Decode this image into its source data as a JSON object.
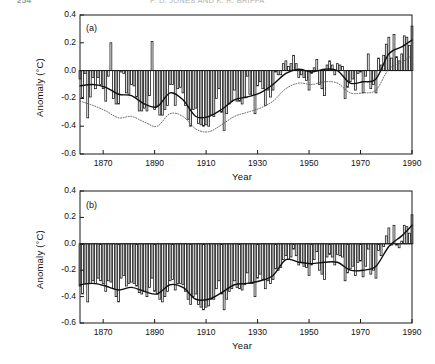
{
  "page": {
    "folio": "254",
    "running_head": "P. D. JONES AND K. R. BRIFFA"
  },
  "figure": {
    "panels": [
      {
        "tag": "(a)",
        "ylabel": "Anomaly (°C)",
        "xlabel": "Year"
      },
      {
        "tag": "(b)",
        "ylabel": "Anomaly (°C)",
        "xlabel": "Year"
      }
    ]
  },
  "chart_data": [
    {
      "type": "bar",
      "panel": "(a)",
      "title": "",
      "xlabel": "Year",
      "ylabel": "Anomaly (°C)",
      "xlim": [
        1861,
        1990
      ],
      "ylim": [
        -0.6,
        0.4
      ],
      "yticks": [
        -0.6,
        -0.4,
        -0.2,
        0.0,
        0.2,
        0.4
      ],
      "xticks": [
        1870,
        1890,
        1910,
        1930,
        1950,
        1970,
        1990
      ],
      "grid": false,
      "legend": null,
      "zero_line": 0.0,
      "series": [
        {
          "name": "Annual anomaly",
          "render": "bar",
          "x": [
            1861,
            1862,
            1863,
            1864,
            1865,
            1866,
            1867,
            1868,
            1869,
            1870,
            1871,
            1872,
            1873,
            1874,
            1875,
            1876,
            1877,
            1878,
            1879,
            1880,
            1881,
            1882,
            1883,
            1884,
            1885,
            1886,
            1887,
            1888,
            1889,
            1890,
            1891,
            1892,
            1893,
            1894,
            1895,
            1896,
            1897,
            1898,
            1899,
            1900,
            1901,
            1902,
            1903,
            1904,
            1905,
            1906,
            1907,
            1908,
            1909,
            1910,
            1911,
            1912,
            1913,
            1914,
            1915,
            1916,
            1917,
            1918,
            1919,
            1920,
            1921,
            1922,
            1923,
            1924,
            1925,
            1926,
            1927,
            1928,
            1929,
            1930,
            1931,
            1932,
            1933,
            1934,
            1935,
            1936,
            1937,
            1938,
            1939,
            1940,
            1941,
            1942,
            1943,
            1944,
            1945,
            1946,
            1947,
            1948,
            1949,
            1950,
            1951,
            1952,
            1953,
            1954,
            1955,
            1956,
            1957,
            1958,
            1959,
            1960,
            1961,
            1962,
            1963,
            1964,
            1965,
            1966,
            1967,
            1968,
            1969,
            1970,
            1971,
            1972,
            1973,
            1974,
            1975,
            1976,
            1977,
            1978,
            1979,
            1980,
            1981,
            1982,
            1983,
            1984,
            1985,
            1986,
            1987,
            1988,
            1989,
            1990
          ],
          "values": [
            -0.06,
            -0.2,
            -0.02,
            -0.34,
            -0.19,
            -0.05,
            -0.13,
            -0.05,
            -0.1,
            -0.13,
            -0.22,
            -0.04,
            0.2,
            -0.2,
            -0.24,
            -0.24,
            -0.01,
            -0.02,
            -0.16,
            -0.17,
            -0.1,
            -0.11,
            -0.19,
            -0.29,
            -0.29,
            -0.27,
            -0.29,
            -0.18,
            0.21,
            -0.28,
            -0.25,
            -0.32,
            -0.32,
            -0.28,
            -0.25,
            -0.1,
            -0.1,
            -0.25,
            -0.13,
            -0.12,
            -0.16,
            -0.25,
            -0.35,
            -0.4,
            -0.28,
            -0.27,
            -0.38,
            -0.39,
            -0.4,
            -0.39,
            -0.4,
            -0.32,
            -0.33,
            -0.2,
            -0.13,
            -0.3,
            -0.43,
            -0.31,
            -0.24,
            -0.22,
            -0.14,
            -0.22,
            -0.22,
            -0.24,
            -0.19,
            -0.04,
            -0.17,
            -0.18,
            -0.31,
            -0.11,
            -0.08,
            -0.13,
            -0.25,
            -0.14,
            -0.19,
            -0.14,
            -0.01,
            -0.03,
            -0.03,
            0.05,
            0.07,
            0.03,
            0.05,
            0.11,
            0.05,
            -0.05,
            -0.03,
            -0.05,
            -0.07,
            -0.14,
            -0.02,
            0.02,
            0.08,
            -0.1,
            -0.13,
            -0.18,
            0.04,
            0.07,
            0.04,
            -0.03,
            0.05,
            0.04,
            0.03,
            -0.2,
            -0.12,
            -0.08,
            -0.06,
            -0.14,
            -0.02,
            -0.01,
            -0.16,
            -0.04,
            0.12,
            -0.13,
            -0.1,
            -0.16,
            0.09,
            0.04,
            0.11,
            0.19,
            0.24,
            0.09,
            0.26,
            0.1,
            0.07,
            0.12,
            0.25,
            0.24,
            0.18,
            0.32
          ]
        },
        {
          "name": "Smoothed (filtered) curve",
          "render": "line-solid",
          "x": [
            1861,
            1866,
            1871,
            1876,
            1881,
            1886,
            1891,
            1896,
            1901,
            1906,
            1911,
            1916,
            1921,
            1926,
            1931,
            1936,
            1941,
            1946,
            1951,
            1956,
            1961,
            1966,
            1971,
            1976,
            1981,
            1986,
            1990
          ],
          "values": [
            -0.11,
            -0.1,
            -0.12,
            -0.17,
            -0.18,
            -0.24,
            -0.26,
            -0.16,
            -0.21,
            -0.33,
            -0.33,
            -0.28,
            -0.21,
            -0.19,
            -0.16,
            -0.1,
            -0.02,
            0.01,
            -0.01,
            0.01,
            0.0,
            -0.09,
            -0.08,
            -0.06,
            0.12,
            0.17,
            0.22
          ]
        },
        {
          "name": "Comparison series (dotted)",
          "render": "line-dotted",
          "x": [
            1861,
            1866,
            1871,
            1876,
            1881,
            1886,
            1891,
            1896,
            1901,
            1906,
            1911,
            1916,
            1921,
            1926,
            1931,
            1936,
            1941,
            1946,
            1951,
            1956,
            1961,
            1966,
            1971,
            1976,
            1981,
            1986,
            1990
          ],
          "values": [
            -0.22,
            -0.25,
            -0.29,
            -0.34,
            -0.33,
            -0.37,
            -0.4,
            -0.31,
            -0.33,
            -0.42,
            -0.44,
            -0.39,
            -0.33,
            -0.3,
            -0.27,
            -0.22,
            -0.13,
            -0.09,
            -0.1,
            -0.08,
            -0.09,
            -0.16,
            -0.16,
            -0.14,
            0.01,
            0.06,
            0.11
          ]
        }
      ]
    },
    {
      "type": "bar",
      "panel": "(b)",
      "title": "",
      "xlabel": "Year",
      "ylabel": "Anomaly (°C)",
      "xlim": [
        1861,
        1990
      ],
      "ylim": [
        -0.6,
        0.4
      ],
      "yticks": [
        -0.6,
        -0.4,
        -0.2,
        0.0,
        0.2,
        0.4
      ],
      "xticks": [
        1870,
        1890,
        1910,
        1930,
        1950,
        1970,
        1990
      ],
      "grid": false,
      "legend": null,
      "zero_line": 0.0,
      "series": [
        {
          "name": "Annual anomaly",
          "render": "bar",
          "x": [
            1861,
            1862,
            1863,
            1864,
            1865,
            1866,
            1867,
            1868,
            1869,
            1870,
            1871,
            1872,
            1873,
            1874,
            1875,
            1876,
            1877,
            1878,
            1879,
            1880,
            1881,
            1882,
            1883,
            1884,
            1885,
            1886,
            1887,
            1888,
            1889,
            1890,
            1891,
            1892,
            1893,
            1894,
            1895,
            1896,
            1897,
            1898,
            1899,
            1900,
            1901,
            1902,
            1903,
            1904,
            1905,
            1906,
            1907,
            1908,
            1909,
            1910,
            1911,
            1912,
            1913,
            1914,
            1915,
            1916,
            1917,
            1918,
            1919,
            1920,
            1921,
            1922,
            1923,
            1924,
            1925,
            1926,
            1927,
            1928,
            1929,
            1930,
            1931,
            1932,
            1933,
            1934,
            1935,
            1936,
            1937,
            1938,
            1939,
            1940,
            1941,
            1942,
            1943,
            1944,
            1945,
            1946,
            1947,
            1948,
            1949,
            1950,
            1951,
            1952,
            1953,
            1954,
            1955,
            1956,
            1957,
            1958,
            1959,
            1960,
            1961,
            1962,
            1963,
            1964,
            1965,
            1966,
            1967,
            1968,
            1969,
            1970,
            1971,
            1972,
            1973,
            1974,
            1975,
            1976,
            1977,
            1978,
            1979,
            1980,
            1981,
            1982,
            1983,
            1984,
            1985,
            1986,
            1987,
            1988,
            1989,
            1990
          ],
          "values": [
            -0.32,
            -0.38,
            -0.3,
            -0.44,
            -0.3,
            -0.28,
            -0.3,
            -0.26,
            -0.28,
            -0.3,
            -0.36,
            -0.28,
            -0.29,
            -0.34,
            -0.4,
            -0.44,
            -0.26,
            -0.24,
            -0.32,
            -0.3,
            -0.29,
            -0.3,
            -0.32,
            -0.37,
            -0.38,
            -0.36,
            -0.4,
            -0.33,
            -0.26,
            -0.36,
            -0.38,
            -0.42,
            -0.44,
            -0.4,
            -0.36,
            -0.28,
            -0.27,
            -0.35,
            -0.3,
            -0.3,
            -0.31,
            -0.36,
            -0.42,
            -0.46,
            -0.4,
            -0.38,
            -0.46,
            -0.48,
            -0.5,
            -0.48,
            -0.47,
            -0.42,
            -0.42,
            -0.34,
            -0.28,
            -0.38,
            -0.5,
            -0.42,
            -0.36,
            -0.34,
            -0.28,
            -0.33,
            -0.34,
            -0.35,
            -0.31,
            -0.22,
            -0.3,
            -0.3,
            -0.4,
            -0.26,
            -0.23,
            -0.27,
            -0.34,
            -0.28,
            -0.3,
            -0.27,
            -0.19,
            -0.2,
            -0.18,
            -0.12,
            -0.09,
            -0.12,
            -0.1,
            -0.04,
            -0.09,
            -0.16,
            -0.14,
            -0.17,
            -0.18,
            -0.24,
            -0.16,
            -0.12,
            -0.06,
            -0.2,
            -0.23,
            -0.27,
            -0.1,
            -0.08,
            -0.1,
            -0.16,
            -0.08,
            -0.09,
            -0.1,
            -0.28,
            -0.22,
            -0.19,
            -0.17,
            -0.24,
            -0.14,
            -0.13,
            -0.25,
            -0.17,
            -0.04,
            -0.23,
            -0.2,
            -0.26,
            -0.05,
            -0.09,
            -0.02,
            0.06,
            0.12,
            -0.01,
            0.14,
            -0.01,
            -0.03,
            0.02,
            0.14,
            0.13,
            0.08,
            0.22
          ]
        },
        {
          "name": "Smoothed (filtered) curve",
          "render": "line-solid",
          "x": [
            1861,
            1866,
            1871,
            1876,
            1881,
            1886,
            1891,
            1896,
            1901,
            1906,
            1911,
            1916,
            1921,
            1926,
            1931,
            1936,
            1941,
            1946,
            1951,
            1956,
            1961,
            1966,
            1971,
            1976,
            1981,
            1986,
            1990
          ],
          "values": [
            -0.31,
            -0.3,
            -0.32,
            -0.35,
            -0.33,
            -0.36,
            -0.38,
            -0.31,
            -0.33,
            -0.42,
            -0.42,
            -0.37,
            -0.31,
            -0.3,
            -0.28,
            -0.24,
            -0.12,
            -0.14,
            -0.15,
            -0.14,
            -0.14,
            -0.2,
            -0.2,
            -0.17,
            -0.02,
            0.06,
            0.14
          ]
        }
      ]
    }
  ]
}
